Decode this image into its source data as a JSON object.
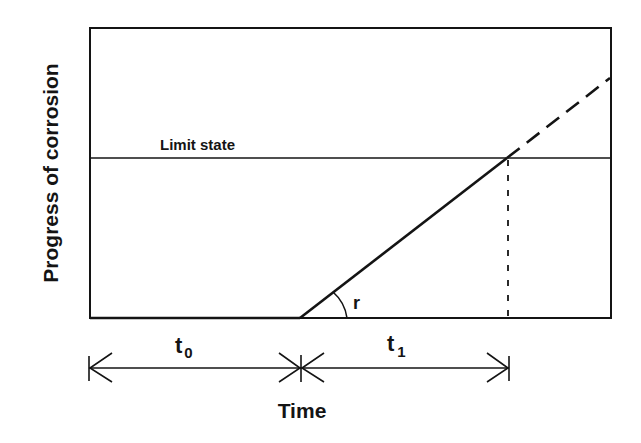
{
  "diagram": {
    "y_axis_title": "Progress of corrosion",
    "x_axis_title": "Time",
    "limit_state_label": "Limit state",
    "slope_label": "r",
    "intervals": [
      {
        "label": "t",
        "subscript": "0",
        "description": "initiation period"
      },
      {
        "label": "t",
        "subscript": "1",
        "description": "propagation period"
      }
    ],
    "colors": {
      "line": "#141414",
      "background": "#ffffff"
    }
  }
}
